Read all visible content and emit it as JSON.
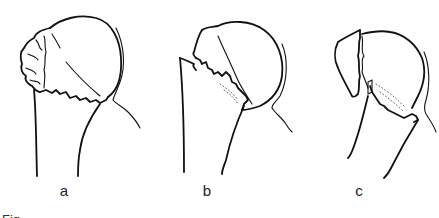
{
  "figure": {
    "panels": [
      {
        "id": "a",
        "label": "a",
        "description": "proximal humerus fracture with comminuted greater tuberosity"
      },
      {
        "id": "b",
        "label": "b",
        "description": "proximal humerus fracture at surgical neck with displaced head"
      },
      {
        "id": "c",
        "label": "c",
        "description": "proximal humerus fracture with separated tuberosity fragment"
      }
    ],
    "caption_partial": "Fig."
  }
}
